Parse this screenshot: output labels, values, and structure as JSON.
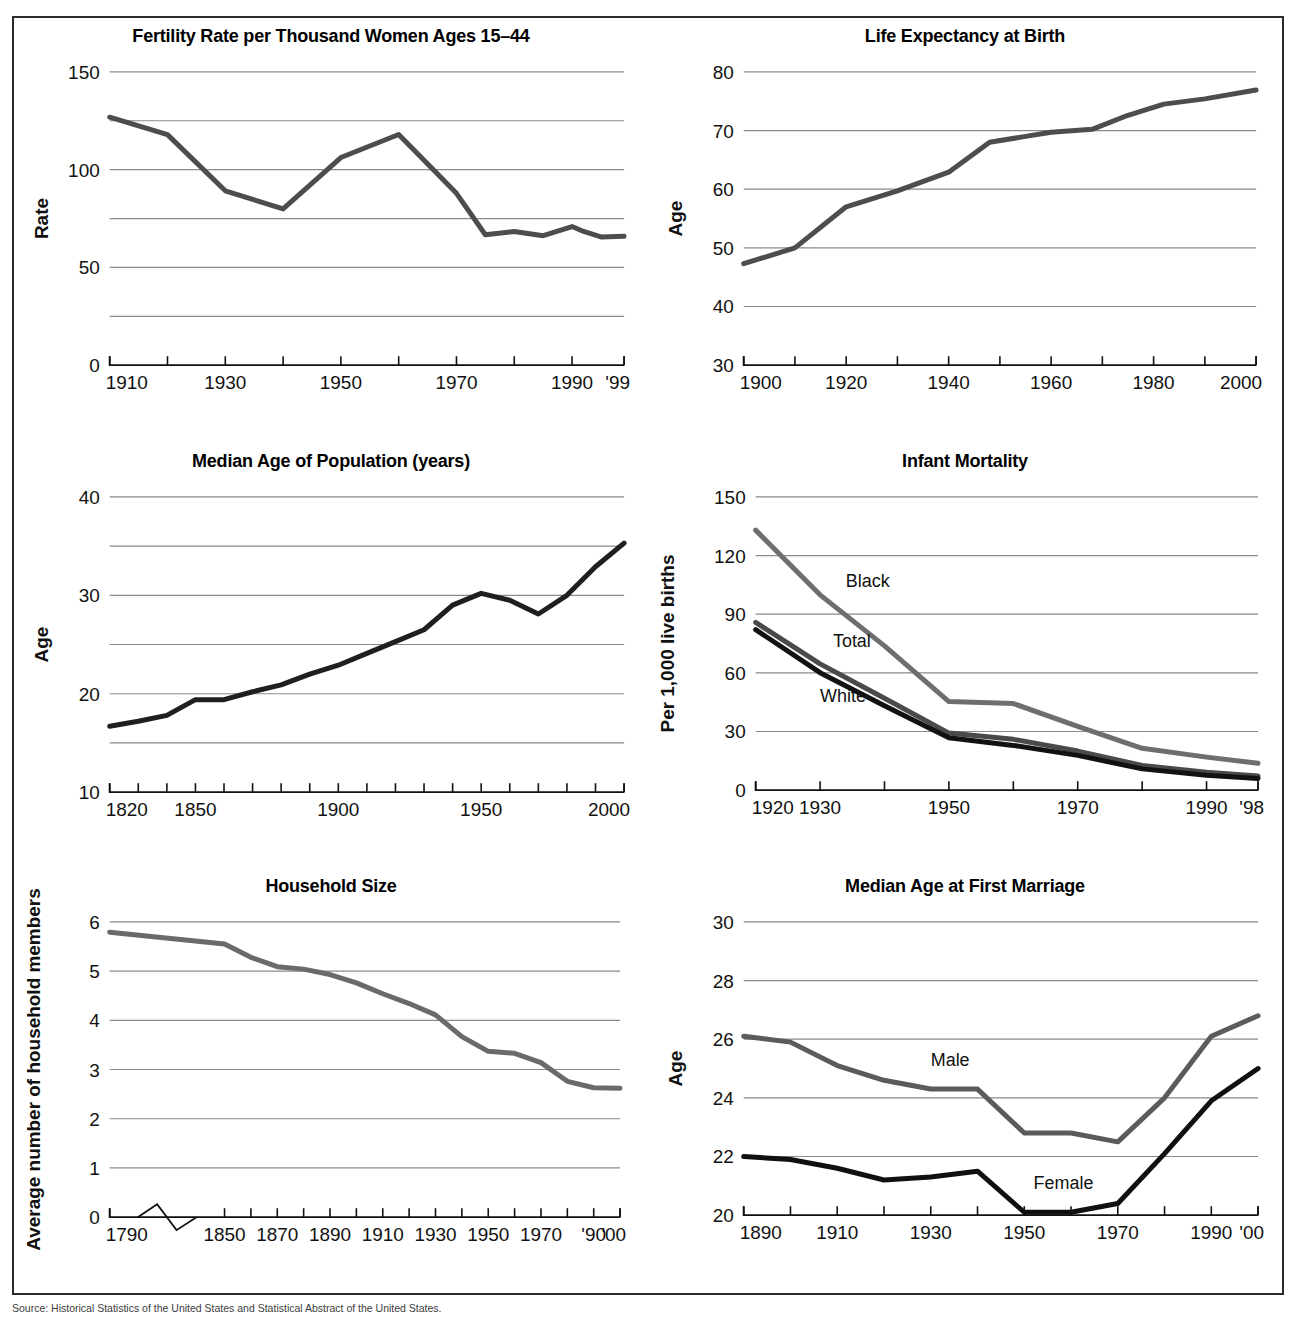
{
  "figure": {
    "source_note": "Source: Historical Statistics of the United States and Statistical Abstract of the United States."
  },
  "chart_data": [
    {
      "id": "fertility",
      "type": "line",
      "title": "Fertility Rate per Thousand Women Ages 15–44",
      "xlabel": "",
      "ylabel": "Rate",
      "ylim": [
        0,
        150
      ],
      "yticks": [
        0,
        50,
        100,
        150
      ],
      "ytick_labels": [
        "0",
        "50",
        "100",
        "150"
      ],
      "gridlines": [
        25,
        50,
        75,
        100,
        125,
        150
      ],
      "xlim": [
        1910,
        1999
      ],
      "xticks": [
        1910,
        1920,
        1930,
        1940,
        1950,
        1960,
        1970,
        1980,
        1990,
        1999
      ],
      "xtick_labels": [
        "1910",
        "1930",
        "1950",
        "1970",
        "1990",
        "'99"
      ],
      "xtick_label_values": [
        1910,
        1930,
        1950,
        1970,
        1990,
        1999
      ],
      "grid": true,
      "legend": "none",
      "series": [
        {
          "name": "Fertility rate",
          "color": "#4d4d4d",
          "width": 5,
          "x": [
            1910,
            1920,
            1930,
            1940,
            1950,
            1960,
            1970,
            1975,
            1980,
            1985,
            1990,
            1992,
            1995,
            1999
          ],
          "values": [
            126.8,
            117.9,
            89.2,
            79.9,
            106.2,
            118.0,
            87.9,
            66.7,
            68.4,
            66.2,
            70.9,
            68.4,
            65.6,
            65.9
          ]
        }
      ]
    },
    {
      "id": "life-expectancy",
      "type": "line",
      "title": "Life Expectancy at Birth",
      "xlabel": "",
      "ylabel": "Age",
      "ylim": [
        30,
        80
      ],
      "yticks": [
        30,
        40,
        50,
        60,
        70,
        80
      ],
      "ytick_labels": [
        "30",
        "40",
        "50",
        "60",
        "70",
        "80"
      ],
      "gridlines": [
        40,
        50,
        60,
        70,
        80
      ],
      "xlim": [
        1900,
        2000
      ],
      "xticks": [
        1900,
        1910,
        1920,
        1930,
        1940,
        1950,
        1960,
        1970,
        1980,
        1990,
        2000
      ],
      "xtick_labels": [
        "1900",
        "1920",
        "1940",
        "1960",
        "1980",
        "2000"
      ],
      "xtick_label_values": [
        1900,
        1920,
        1940,
        1960,
        1980,
        2000
      ],
      "grid": true,
      "legend": "none",
      "series": [
        {
          "name": "Life expectancy",
          "color": "#4d4d4d",
          "width": 5,
          "x": [
            1900,
            1910,
            1920,
            1930,
            1940,
            1948,
            1955,
            1960,
            1968,
            1975,
            1982,
            1990,
            2000
          ],
          "values": [
            47.3,
            50.0,
            57.0,
            59.7,
            62.9,
            68.0,
            69.0,
            69.7,
            70.2,
            72.6,
            74.5,
            75.4,
            76.9
          ]
        }
      ]
    },
    {
      "id": "median-age-population",
      "type": "line",
      "title": "Median Age of Population (years)",
      "xlabel": "",
      "ylabel": "Age",
      "ylim": [
        10,
        40
      ],
      "yticks": [
        10,
        20,
        30,
        40
      ],
      "ytick_labels": [
        "10",
        "20",
        "30",
        "40"
      ],
      "gridlines": [
        15,
        20,
        25,
        30,
        35,
        40
      ],
      "xlim": [
        1820,
        2000
      ],
      "xticks": [
        1820,
        1830,
        1840,
        1850,
        1860,
        1870,
        1880,
        1890,
        1900,
        1910,
        1920,
        1930,
        1940,
        1950,
        1960,
        1970,
        1980,
        1990,
        2000
      ],
      "xtick_labels": [
        "1820",
        "1850",
        "1900",
        "1950",
        "2000"
      ],
      "xtick_label_values": [
        1820,
        1850,
        1900,
        1950,
        2000
      ],
      "grid": true,
      "legend": "none",
      "series": [
        {
          "name": "Median age",
          "color": "#1f1f1f",
          "width": 5,
          "x": [
            1820,
            1830,
            1840,
            1850,
            1860,
            1870,
            1880,
            1890,
            1900,
            1910,
            1920,
            1930,
            1940,
            1950,
            1960,
            1970,
            1980,
            1990,
            2000
          ],
          "values": [
            16.7,
            17.2,
            17.8,
            19.4,
            19.4,
            20.2,
            20.9,
            22.0,
            22.9,
            24.1,
            25.3,
            26.5,
            29.0,
            30.2,
            29.5,
            28.1,
            30.0,
            32.9,
            35.3
          ]
        }
      ]
    },
    {
      "id": "infant-mortality",
      "type": "line",
      "title": "Infant Mortality",
      "xlabel": "",
      "ylabel": "Per 1,000 live births",
      "ylim": [
        0,
        150
      ],
      "yticks": [
        0,
        30,
        60,
        90,
        120,
        150
      ],
      "ytick_labels": [
        "0",
        "30",
        "60",
        "90",
        "120",
        "150"
      ],
      "gridlines": [
        30,
        60,
        90,
        120,
        150
      ],
      "xlim": [
        1920,
        1998
      ],
      "xticks": [
        1920,
        1930,
        1940,
        1950,
        1960,
        1970,
        1980,
        1990,
        1998
      ],
      "xtick_labels": [
        "1920",
        "1930",
        "1950",
        "1970",
        "1990",
        "'98"
      ],
      "xtick_label_values": [
        1920,
        1930,
        1950,
        1970,
        1990,
        1998
      ],
      "grid": true,
      "legend": "inline",
      "series": [
        {
          "name": "Black",
          "label_x": 1934,
          "label_y": 104,
          "color": "#6e6e6e",
          "width": 5,
          "x": [
            1920,
            1930,
            1940,
            1950,
            1960,
            1970,
            1980,
            1990,
            1998
          ],
          "values": [
            133.0,
            99.9,
            73.8,
            45.3,
            44.3,
            32.6,
            21.4,
            16.9,
            13.8
          ]
        },
        {
          "name": "Total",
          "label_x": 1932,
          "label_y": 73,
          "color": "#4a4a4a",
          "width": 5,
          "x": [
            1920,
            1930,
            1940,
            1950,
            1960,
            1970,
            1980,
            1990,
            1998
          ],
          "values": [
            85.8,
            64.6,
            47.0,
            29.2,
            26.0,
            20.0,
            12.6,
            9.2,
            7.2
          ]
        },
        {
          "name": "White",
          "label_x": 1930,
          "label_y": 45,
          "color": "#121212",
          "width": 5,
          "x": [
            1920,
            1930,
            1940,
            1950,
            1960,
            1970,
            1980,
            1990,
            1998
          ],
          "values": [
            82.1,
            60.1,
            43.2,
            26.8,
            22.9,
            17.8,
            10.9,
            7.6,
            6.0
          ]
        }
      ]
    },
    {
      "id": "household-size",
      "type": "line",
      "title": "Household Size",
      "xlabel": "",
      "ylabel": "Average number of household members",
      "ylim": [
        0,
        6
      ],
      "yticks": [
        0,
        1,
        2,
        3,
        4,
        5,
        6
      ],
      "ytick_labels": [
        "0",
        "1",
        "2",
        "3",
        "4",
        "5",
        "6"
      ],
      "gridlines": [
        1,
        2,
        3,
        4,
        5,
        6
      ],
      "xlim": [
        1790,
        2000
      ],
      "axis_break": true,
      "xticks": [
        1790,
        1850,
        1860,
        1870,
        1880,
        1890,
        1900,
        1910,
        1920,
        1930,
        1940,
        1950,
        1960,
        1970,
        1980,
        1990,
        2000
      ],
      "xtick_labels": [
        "1790",
        "1850",
        "1870",
        "1890",
        "1910",
        "1930",
        "1950",
        "1970",
        "'90",
        "'00"
      ],
      "xtick_label_values": [
        1790,
        1850,
        1870,
        1890,
        1910,
        1930,
        1950,
        1970,
        1990,
        2000
      ],
      "grid": true,
      "legend": "none",
      "series": [
        {
          "name": "Household size",
          "color": "#6a6a6a",
          "width": 5,
          "x": [
            1790,
            1850,
            1860,
            1870,
            1880,
            1890,
            1900,
            1910,
            1920,
            1930,
            1940,
            1950,
            1960,
            1970,
            1980,
            1990,
            2000
          ],
          "values": [
            5.79,
            5.55,
            5.28,
            5.09,
            5.04,
            4.93,
            4.76,
            4.54,
            4.34,
            4.11,
            3.67,
            3.37,
            3.33,
            3.14,
            2.76,
            2.63,
            2.62
          ]
        }
      ]
    },
    {
      "id": "median-age-first-marriage",
      "type": "line",
      "title": "Median Age at First Marriage",
      "xlabel": "",
      "ylabel": "Age",
      "ylim": [
        20,
        30
      ],
      "yticks": [
        20,
        22,
        24,
        26,
        28,
        30
      ],
      "ytick_labels": [
        "20",
        "22",
        "24",
        "26",
        "28",
        "30"
      ],
      "gridlines": [
        22,
        24,
        26,
        28,
        30
      ],
      "xlim": [
        1890,
        2000
      ],
      "xticks": [
        1890,
        1900,
        1910,
        1920,
        1930,
        1940,
        1950,
        1960,
        1970,
        1980,
        1990,
        2000
      ],
      "xtick_labels": [
        "1890",
        "1910",
        "1930",
        "1950",
        "1970",
        "1990",
        "'00"
      ],
      "xtick_label_values": [
        1890,
        1910,
        1930,
        1950,
        1970,
        1990,
        2000
      ],
      "grid": true,
      "legend": "inline",
      "series": [
        {
          "name": "Male",
          "label_x": 1930,
          "label_y": 25.1,
          "color": "#5b5b5b",
          "width": 5,
          "x": [
            1890,
            1900,
            1910,
            1920,
            1930,
            1940,
            1950,
            1960,
            1970,
            1980,
            1990,
            2000
          ],
          "values": [
            26.1,
            25.9,
            25.1,
            24.6,
            24.3,
            24.3,
            22.8,
            22.8,
            22.5,
            24.0,
            26.1,
            26.8
          ]
        },
        {
          "name": "Female",
          "label_x": 1952,
          "label_y": 20.9,
          "color": "#101010",
          "width": 5,
          "x": [
            1890,
            1900,
            1910,
            1920,
            1930,
            1940,
            1950,
            1960,
            1970,
            1980,
            1990,
            2000
          ],
          "values": [
            22.0,
            21.9,
            21.6,
            21.2,
            21.3,
            21.5,
            20.1,
            20.1,
            20.4,
            22.1,
            23.9,
            25.0
          ]
        }
      ]
    }
  ]
}
